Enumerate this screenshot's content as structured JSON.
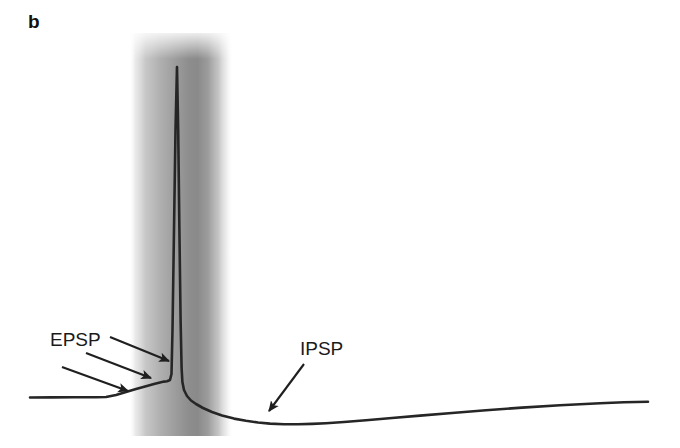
{
  "figure": {
    "panel_label": "b",
    "background_color": "#ffffff",
    "width": 680,
    "height": 448
  },
  "annotations": {
    "epsp": {
      "label": "EPSP",
      "description": "excitatory postsynaptic potential",
      "arrow_count": 3
    },
    "ipsp": {
      "label": "IPSP",
      "description": "inhibitory postsynaptic potential",
      "arrow_count": 1
    }
  },
  "stimulus_band": {
    "name": "stimulus-artifact-band",
    "x_start": 129,
    "x_end": 233,
    "y_start": 33,
    "y_end": 436,
    "center_x": 192,
    "peak_gray": "#8a8a8a",
    "edge_gray": "#ffffff"
  },
  "chart_data": {
    "type": "line",
    "title": "",
    "subtitle": "",
    "xlabel": "",
    "ylabel": "",
    "grid": false,
    "legend": null,
    "axis_visible": false,
    "trace_color": "#262626",
    "trace_width": 2.6,
    "xlim": [
      0,
      680
    ],
    "ylim": [
      448,
      0
    ],
    "series": [
      {
        "name": "membrane-potential-trace",
        "points": [
          [
            30,
            397.5
          ],
          [
            52,
            397.4
          ],
          [
            74,
            397.3
          ],
          [
            96,
            397.2
          ],
          [
            106,
            397.0
          ],
          [
            116,
            395.0
          ],
          [
            126,
            392.0
          ],
          [
            136,
            389.0
          ],
          [
            146,
            386.2
          ],
          [
            154,
            384.0
          ],
          [
            160,
            382.4
          ],
          [
            164,
            381.6
          ],
          [
            167,
            381.3
          ],
          [
            170,
            380.0
          ],
          [
            171.5,
            374.0
          ],
          [
            172.5,
            330.0
          ],
          [
            174,
            230.0
          ],
          [
            175.5,
            130.0
          ],
          [
            177,
            67.0
          ],
          [
            178.2,
            130.0
          ],
          [
            179.4,
            230.0
          ],
          [
            180.6,
            320.0
          ],
          [
            181.6,
            368.0
          ],
          [
            182.4,
            382.0
          ],
          [
            184,
            390.0
          ],
          [
            187,
            396.0
          ],
          [
            191,
            400.5
          ],
          [
            196,
            404.0
          ],
          [
            203,
            408.0
          ],
          [
            212,
            412.0
          ],
          [
            222,
            415.5
          ],
          [
            234,
            418.6
          ],
          [
            246,
            420.8
          ],
          [
            258,
            422.5
          ],
          [
            270,
            423.6
          ],
          [
            284,
            424.2
          ],
          [
            298,
            424.3
          ],
          [
            312,
            423.9
          ],
          [
            326,
            423.2
          ],
          [
            344,
            422.0
          ],
          [
            366,
            420.2
          ],
          [
            392,
            418.0
          ],
          [
            420,
            415.6
          ],
          [
            452,
            413.0
          ],
          [
            486,
            410.3
          ],
          [
            522,
            407.6
          ],
          [
            560,
            405.2
          ],
          [
            600,
            403.2
          ],
          [
            624,
            402.3
          ],
          [
            648,
            401.8
          ]
        ]
      }
    ],
    "features": [
      {
        "name": "baseline",
        "y": 397.5,
        "x_from": 30,
        "x_to": 105
      },
      {
        "name": "epsp-rise",
        "x_from": 106,
        "x_to": 170,
        "y_from": 397.0,
        "y_to": 380.0
      },
      {
        "name": "action-potential-peak",
        "x": 177,
        "y": 67
      },
      {
        "name": "ipsp-trough",
        "x": 292,
        "y": 424.3
      },
      {
        "name": "recovery",
        "x_from": 312,
        "x_to": 648,
        "y_from": 423.9,
        "y_to": 401.8
      }
    ],
    "arrows": [
      {
        "name": "epsp-arrow-lower",
        "x1": 62,
        "y1": 367,
        "x2": 128,
        "y2": 391
      },
      {
        "name": "epsp-arrow-middle",
        "x1": 86,
        "y1": 353,
        "x2": 151,
        "y2": 378
      },
      {
        "name": "epsp-arrow-upper",
        "x1": 110,
        "y1": 337,
        "x2": 169,
        "y2": 361
      },
      {
        "name": "ipsp-arrow",
        "x1": 304,
        "y1": 364,
        "x2": 269,
        "y2": 411
      }
    ]
  }
}
